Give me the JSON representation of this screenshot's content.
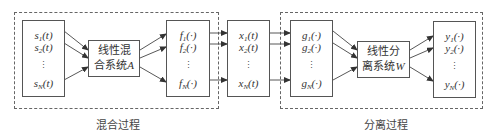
{
  "diagram": {
    "type": "block-diagram",
    "groups": [
      {
        "id": "mixing",
        "caption": "混合过程"
      },
      {
        "id": "separation",
        "caption": "分离过程"
      }
    ],
    "blocks": {
      "sources": {
        "items": [
          {
            "base": "s",
            "sub": "1",
            "arg": "(t)"
          },
          {
            "base": "s",
            "sub": "2",
            "arg": "(t)"
          },
          {
            "base": "s",
            "sub": "N",
            "arg": "(t)"
          }
        ]
      },
      "mixing_system": {
        "line1": "线性混",
        "line2": "合系统",
        "symbol": "A"
      },
      "nonlinear_f": {
        "items": [
          {
            "base": "f",
            "sub": "1",
            "arg": "(·)"
          },
          {
            "base": "f",
            "sub": "2",
            "arg": "(·)"
          },
          {
            "base": "f",
            "sub": "N",
            "arg": "(·)"
          }
        ]
      },
      "observations": {
        "items": [
          {
            "base": "x",
            "sub": "1",
            "arg": "(t)"
          },
          {
            "base": "x",
            "sub": "2",
            "arg": "(t)"
          },
          {
            "base": "x",
            "sub": "N",
            "arg": "(t)"
          }
        ]
      },
      "nonlinear_g": {
        "items": [
          {
            "base": "g",
            "sub": "1",
            "arg": "(·)"
          },
          {
            "base": "g",
            "sub": "2",
            "arg": "(·)"
          },
          {
            "base": "g",
            "sub": "N",
            "arg": "(·)"
          }
        ]
      },
      "separation_system": {
        "line1": "线性分",
        "line2": "离系统",
        "symbol": "W"
      },
      "outputs": {
        "items": [
          {
            "base": "y",
            "sub": "1",
            "arg": "(·)"
          },
          {
            "base": "y",
            "sub": "2",
            "arg": "(·)"
          },
          {
            "base": "y",
            "sub": "N",
            "arg": "(·)"
          }
        ]
      }
    },
    "vdots": "⋮",
    "edges": [
      [
        "sources",
        "mixing_system"
      ],
      [
        "mixing_system",
        "nonlinear_f"
      ],
      [
        "nonlinear_f",
        "observations"
      ],
      [
        "observations",
        "nonlinear_g"
      ],
      [
        "nonlinear_g",
        "separation_system"
      ],
      [
        "separation_system",
        "outputs"
      ]
    ],
    "colors": {
      "line": "#555555",
      "dash": "#666666",
      "text": "#333333"
    }
  }
}
